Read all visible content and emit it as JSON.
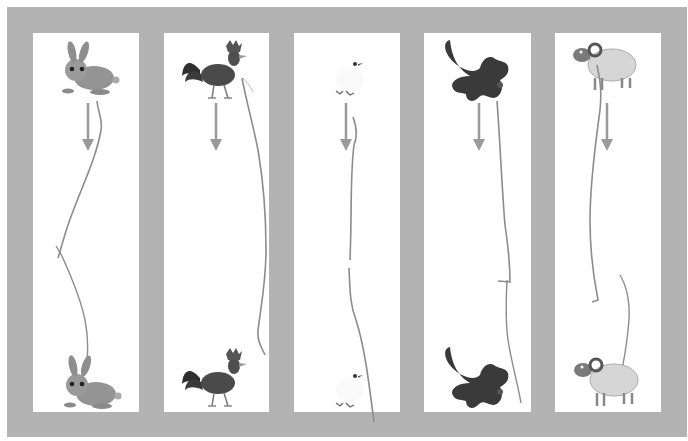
{
  "worksheet": {
    "frame_color": "#b3b3b3",
    "panel_color": "#ffffff",
    "arrow_color": "#9a9a9a",
    "line_color": "#8c8c8c",
    "panels": [
      {
        "animal": "rabbit",
        "top_animal": "rabbit",
        "bottom_animal": "rabbit",
        "color": "#8f8f8f"
      },
      {
        "animal": "rooster",
        "top_animal": "rooster",
        "bottom_animal": "rooster",
        "color": "#4a4a4a"
      },
      {
        "animal": "chick",
        "top_animal": "chick",
        "bottom_animal": "chick",
        "color": "#e8e8e8"
      },
      {
        "animal": "dog",
        "top_animal": "dog",
        "bottom_animal": "dog",
        "color": "#3a3a3a"
      },
      {
        "animal": "ram",
        "top_animal": "ram",
        "bottom_animal": "ram",
        "color": "#d8d8d8"
      }
    ]
  }
}
